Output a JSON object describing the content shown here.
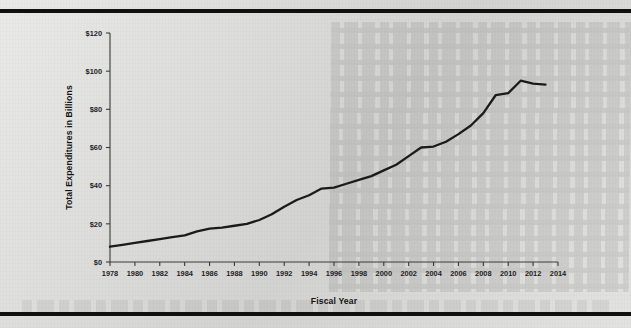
{
  "page": {
    "background_color": "#d9d9d7",
    "rule_color": "#101010",
    "has_top_rule": true,
    "has_bottom_rule": true
  },
  "chart_data": {
    "type": "line",
    "title": "",
    "xlabel": "Fiscal Year",
    "ylabel": "Total Expenditures in Billions",
    "xlim": [
      1978,
      2014
    ],
    "ylim": [
      0,
      120
    ],
    "grid": false,
    "legend": null,
    "line_color": "#1b1b1b",
    "axis_color": "#3b3b3b",
    "x_tick_labels": [
      "1978",
      "1980",
      "1982",
      "1984",
      "1986",
      "1988",
      "1990",
      "1992",
      "1994",
      "1996",
      "1998",
      "2000",
      "2002",
      "2004",
      "2006",
      "2008",
      "2010",
      "2012",
      "2014"
    ],
    "x_tick_values": [
      1978,
      1980,
      1982,
      1984,
      1986,
      1988,
      1990,
      1992,
      1994,
      1996,
      1998,
      2000,
      2002,
      2004,
      2006,
      2008,
      2010,
      2012,
      2014
    ],
    "y_tick_labels": [
      "$0",
      "$20",
      "$40",
      "$60",
      "$80",
      "$100",
      "$120"
    ],
    "y_tick_values": [
      0,
      20,
      40,
      60,
      80,
      100,
      120
    ],
    "series": [
      {
        "name": "Total Expenditures",
        "x": [
          1978,
          1979,
          1980,
          1981,
          1982,
          1983,
          1984,
          1985,
          1986,
          1987,
          1988,
          1989,
          1990,
          1991,
          1992,
          1993,
          1994,
          1995,
          1996,
          1997,
          1998,
          1999,
          2000,
          2001,
          2002,
          2003,
          2004,
          2005,
          2006,
          2007,
          2008,
          2009,
          2010,
          2011,
          2012,
          2013
        ],
        "values": [
          8,
          9,
          10,
          11,
          12,
          13,
          14,
          16,
          17.5,
          18,
          19,
          20,
          22,
          25,
          29,
          32.5,
          35,
          38.5,
          39,
          41,
          43,
          45,
          48,
          51,
          55.5,
          60,
          60.5,
          63,
          67,
          71.5,
          78,
          87.5,
          88.5,
          95,
          93.5,
          93
        ]
      }
    ]
  }
}
